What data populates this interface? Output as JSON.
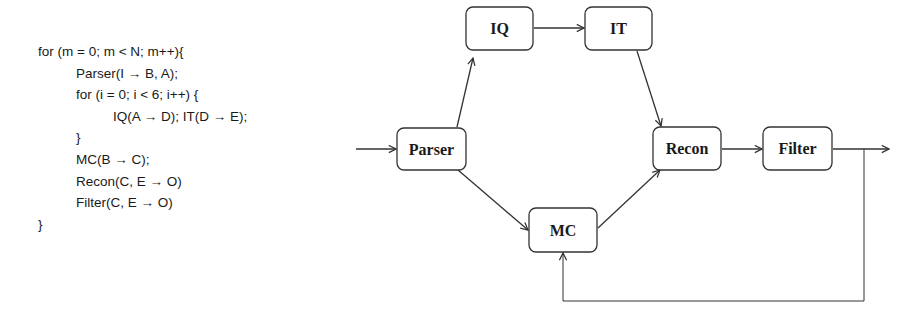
{
  "code": {
    "lines": [
      {
        "indent": 0,
        "text": "for (m = 0; m < N; m++){"
      },
      {
        "indent": 1,
        "text": "Parser(I → B, A);"
      },
      {
        "indent": 1,
        "text": "for (i = 0; i < 6; i++) {"
      },
      {
        "indent": 2,
        "text": "IQ(A → D); IT(D → E);"
      },
      {
        "indent": 1,
        "text": "}"
      },
      {
        "indent": 1,
        "text": "MC(B → C);"
      },
      {
        "indent": 1,
        "text": "Recon(C, E → O)"
      },
      {
        "indent": 1,
        "text": "Filter(C, E → O)"
      },
      {
        "indent": 0,
        "text": "}"
      }
    ]
  },
  "diagram": {
    "nodes": {
      "parser": {
        "label": "Parser"
      },
      "iq": {
        "label": "IQ"
      },
      "it": {
        "label": "IT"
      },
      "mc": {
        "label": "MC"
      },
      "recon": {
        "label": "Recon"
      },
      "filter": {
        "label": "Filter"
      }
    },
    "edges": [
      {
        "from": "input",
        "to": "parser"
      },
      {
        "from": "parser",
        "to": "iq"
      },
      {
        "from": "iq",
        "to": "it"
      },
      {
        "from": "it",
        "to": "recon"
      },
      {
        "from": "parser",
        "to": "mc"
      },
      {
        "from": "mc",
        "to": "recon"
      },
      {
        "from": "recon",
        "to": "filter"
      },
      {
        "from": "filter",
        "to": "output"
      },
      {
        "from": "filter",
        "to": "mc",
        "type": "feedback"
      }
    ],
    "colors": {
      "stroke": "#333333",
      "text": "#1a1a1a",
      "background": "#ffffff"
    }
  }
}
